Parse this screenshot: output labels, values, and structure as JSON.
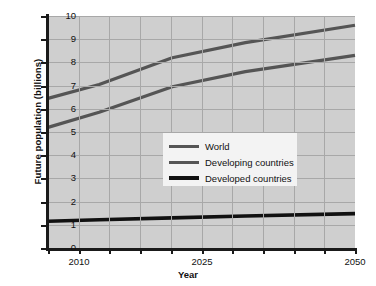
{
  "chart_data": {
    "type": "line",
    "title": "",
    "xlabel": "Year",
    "ylabel": "Future population (billions)",
    "xlim": [
      2008,
      2050
    ],
    "ylim": [
      0,
      10
    ],
    "grid": true,
    "legend_position": "center",
    "xticks": [
      2010,
      2025,
      2050
    ],
    "xtick_labels": [
      "2010",
      "2025",
      "2050"
    ],
    "yticks": [
      0,
      1,
      2,
      3,
      4,
      5,
      6,
      7,
      8,
      9,
      10
    ],
    "ytick_labels": [
      "0",
      "1",
      "2",
      "3",
      "4",
      "5",
      "6",
      "7",
      "8",
      "9",
      "10"
    ],
    "x": [
      2008,
      2015,
      2025,
      2035,
      2050
    ],
    "series": [
      {
        "name": "World",
        "color": "#555555",
        "values": [
          6.45,
          7.05,
          8.2,
          8.85,
          9.6
        ]
      },
      {
        "name": "Developing countries",
        "color": "#555555",
        "values": [
          5.2,
          5.85,
          6.95,
          7.6,
          8.3
        ]
      },
      {
        "name": "Developed countries",
        "color": "#111111",
        "values": [
          1.15,
          1.22,
          1.3,
          1.38,
          1.48
        ]
      }
    ]
  },
  "legend": {
    "entries": [
      {
        "label": "World"
      },
      {
        "label": "Developing countries"
      },
      {
        "label": "Developed countries"
      }
    ]
  },
  "axes": {
    "x_title": "Year",
    "y_title": "Future population (billions)"
  },
  "colors": {
    "plot_background": "#cfcfcf",
    "gridline": "#a8a8a8",
    "axis": "#1a1a1a",
    "legend_background": "#f3f3f3",
    "world_line": "#555555",
    "developing_line": "#555555",
    "developed_line": "#111111"
  }
}
